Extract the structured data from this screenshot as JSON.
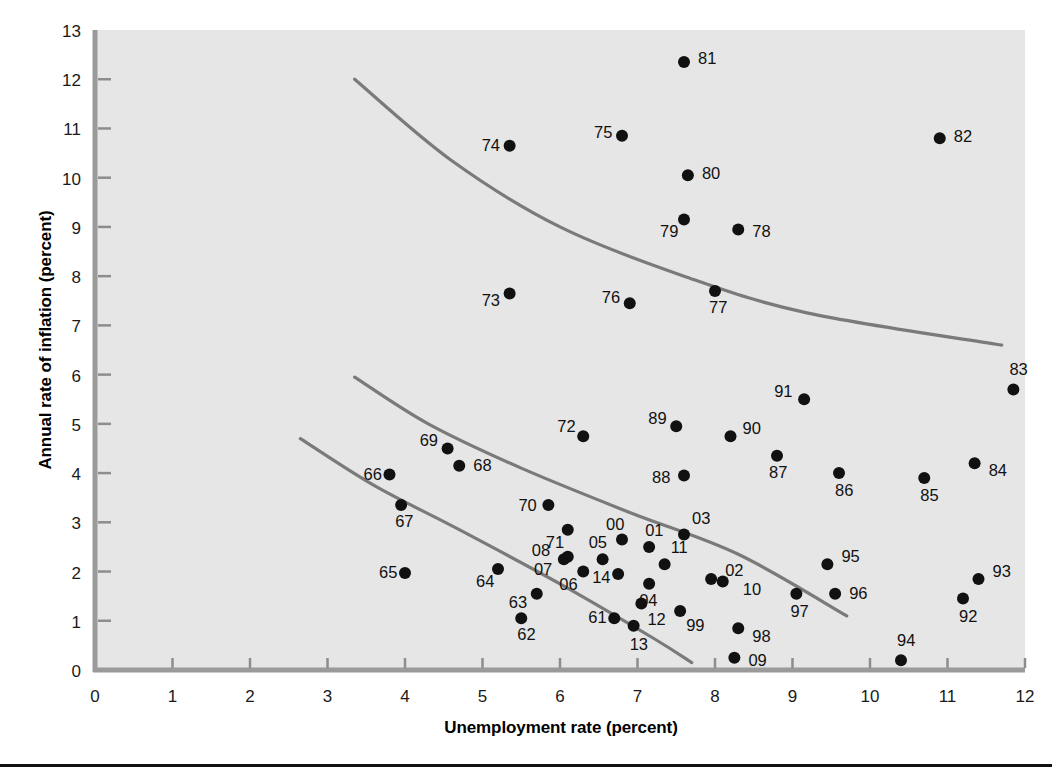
{
  "figure": {
    "background_color": "#ffffff",
    "plot_background_color": "#e6e6e6",
    "axis_color": "#9a9a9a",
    "curve_color": "#7a7a7a",
    "point_color": "#111111"
  },
  "axes": {
    "x_title": "Unemployment rate (percent)",
    "y_title": "Annual rate of inflation (percent)",
    "x_ticks": [
      "0",
      "1",
      "2",
      "3",
      "4",
      "5",
      "6",
      "7",
      "8",
      "9",
      "10",
      "11",
      "12"
    ],
    "y_ticks": [
      "0",
      "1",
      "2",
      "3",
      "4",
      "5",
      "6",
      "7",
      "8",
      "9",
      "10",
      "11",
      "12",
      "13"
    ]
  },
  "chart_data": {
    "type": "scatter",
    "title": "",
    "xlabel": "Unemployment rate (percent)",
    "ylabel": "Annual rate of inflation (percent)",
    "xlim": [
      0,
      12
    ],
    "ylim": [
      0,
      13
    ],
    "grid": false,
    "legend": "none",
    "point_label_position": "varies",
    "points": [
      {
        "label": "61",
        "x": 6.7,
        "y": 1.05,
        "lx": -26,
        "ly": 5
      },
      {
        "label": "62",
        "x": 5.5,
        "y": 1.05,
        "lx": -4,
        "ly": 22
      },
      {
        "label": "63",
        "x": 5.7,
        "y": 1.55,
        "lx": -28,
        "ly": 14
      },
      {
        "label": "64",
        "x": 5.2,
        "y": 2.05,
        "lx": -22,
        "ly": 18
      },
      {
        "label": "65",
        "x": 4.0,
        "y": 1.97,
        "lx": -26,
        "ly": 5
      },
      {
        "label": "66",
        "x": 3.8,
        "y": 3.97,
        "lx": -26,
        "ly": 5
      },
      {
        "label": "67",
        "x": 3.95,
        "y": 3.35,
        "lx": -6,
        "ly": 22
      },
      {
        "label": "68",
        "x": 4.7,
        "y": 4.15,
        "lx": 14,
        "ly": 5
      },
      {
        "label": "69",
        "x": 4.55,
        "y": 4.5,
        "lx": -28,
        "ly": -2
      },
      {
        "label": "70",
        "x": 5.85,
        "y": 3.35,
        "lx": -30,
        "ly": 6
      },
      {
        "label": "71",
        "x": 6.1,
        "y": 2.85,
        "lx": -22,
        "ly": 18
      },
      {
        "label": "72",
        "x": 6.3,
        "y": 4.75,
        "lx": -26,
        "ly": -4
      },
      {
        "label": "73",
        "x": 5.35,
        "y": 7.65,
        "lx": -28,
        "ly": 13
      },
      {
        "label": "74",
        "x": 5.35,
        "y": 10.65,
        "lx": -28,
        "ly": 5
      },
      {
        "label": "75",
        "x": 6.8,
        "y": 10.85,
        "lx": -28,
        "ly": 2
      },
      {
        "label": "76",
        "x": 6.9,
        "y": 7.45,
        "lx": -28,
        "ly": 0
      },
      {
        "label": "77",
        "x": 8.0,
        "y": 7.7,
        "lx": -6,
        "ly": 22
      },
      {
        "label": "78",
        "x": 8.3,
        "y": 8.95,
        "lx": 14,
        "ly": 8
      },
      {
        "label": "79",
        "x": 7.6,
        "y": 9.15,
        "lx": -24,
        "ly": 17
      },
      {
        "label": "80",
        "x": 7.65,
        "y": 10.05,
        "lx": 14,
        "ly": 4
      },
      {
        "label": "81",
        "x": 7.6,
        "y": 12.35,
        "lx": 14,
        "ly": 2
      },
      {
        "label": "82",
        "x": 10.9,
        "y": 10.8,
        "lx": 14,
        "ly": 4
      },
      {
        "label": "83",
        "x": 11.85,
        "y": 5.7,
        "lx": -4,
        "ly": -14
      },
      {
        "label": "84",
        "x": 11.35,
        "y": 4.2,
        "lx": 14,
        "ly": 13
      },
      {
        "label": "85",
        "x": 10.7,
        "y": 3.9,
        "lx": -4,
        "ly": 23
      },
      {
        "label": "86",
        "x": 9.6,
        "y": 4.0,
        "lx": -4,
        "ly": 23
      },
      {
        "label": "87",
        "x": 8.8,
        "y": 4.35,
        "lx": -8,
        "ly": 22
      },
      {
        "label": "88",
        "x": 7.6,
        "y": 3.95,
        "lx": -32,
        "ly": 7
      },
      {
        "label": "89",
        "x": 7.5,
        "y": 4.95,
        "lx": -28,
        "ly": -2
      },
      {
        "label": "90",
        "x": 8.2,
        "y": 4.75,
        "lx": 12,
        "ly": -2
      },
      {
        "label": "91",
        "x": 9.15,
        "y": 5.5,
        "lx": -30,
        "ly": -2
      },
      {
        "label": "92",
        "x": 11.2,
        "y": 1.45,
        "lx": -4,
        "ly": 23
      },
      {
        "label": "93",
        "x": 11.4,
        "y": 1.85,
        "lx": 14,
        "ly": -2
      },
      {
        "label": "94",
        "x": 10.4,
        "y": 0.2,
        "lx": -4,
        "ly": -14
      },
      {
        "label": "95",
        "x": 9.45,
        "y": 2.15,
        "lx": 14,
        "ly": -2
      },
      {
        "label": "96",
        "x": 9.55,
        "y": 1.55,
        "lx": 14,
        "ly": 5
      },
      {
        "label": "97",
        "x": 9.05,
        "y": 1.55,
        "lx": -6,
        "ly": 23
      },
      {
        "label": "98",
        "x": 8.3,
        "y": 0.85,
        "lx": 14,
        "ly": 14
      },
      {
        "label": "99",
        "x": 7.55,
        "y": 1.2,
        "lx": 6,
        "ly": 20
      },
      {
        "label": "00",
        "x": 6.8,
        "y": 2.65,
        "lx": -16,
        "ly": -10
      },
      {
        "label": "01",
        "x": 7.15,
        "y": 2.5,
        "lx": -4,
        "ly": -11
      },
      {
        "label": "02",
        "x": 7.95,
        "y": 1.85,
        "lx": 14,
        "ly": -3
      },
      {
        "label": "03",
        "x": 7.6,
        "y": 2.75,
        "lx": 8,
        "ly": -11
      },
      {
        "label": "04",
        "x": 7.15,
        "y": 1.75,
        "lx": -10,
        "ly": 22
      },
      {
        "label": "05",
        "x": 6.55,
        "y": 2.25,
        "lx": -14,
        "ly": -11
      },
      {
        "label": "06",
        "x": 6.3,
        "y": 2.0,
        "lx": -24,
        "ly": 18
      },
      {
        "label": "07",
        "x": 6.05,
        "y": 2.25,
        "lx": -30,
        "ly": 16
      },
      {
        "label": "08",
        "x": 6.1,
        "y": 2.3,
        "lx": -36,
        "ly": -1
      },
      {
        "label": "09",
        "x": 8.25,
        "y": 0.25,
        "lx": 14,
        "ly": 8
      },
      {
        "label": "10",
        "x": 8.1,
        "y": 1.8,
        "lx": 20,
        "ly": 14
      },
      {
        "label": "11",
        "x": 7.35,
        "y": 2.15,
        "lx": 6,
        "ly": -11
      },
      {
        "label": "12",
        "x": 7.05,
        "y": 1.35,
        "lx": 6,
        "ly": 21
      },
      {
        "label": "13",
        "x": 6.95,
        "y": 0.9,
        "lx": -4,
        "ly": 24
      },
      {
        "label": "14",
        "x": 6.75,
        "y": 1.95,
        "lx": -26,
        "ly": 9
      }
    ],
    "curves": [
      {
        "name": "upper-phillips-curve",
        "points": [
          [
            3.35,
            12.0
          ],
          [
            4.6,
            10.35
          ],
          [
            6.0,
            9.0
          ],
          [
            7.6,
            8.0
          ],
          [
            9.2,
            7.25
          ],
          [
            11.7,
            6.6
          ]
        ]
      },
      {
        "name": "middle-phillips-curve",
        "points": [
          [
            3.35,
            5.95
          ],
          [
            4.3,
            5.0
          ],
          [
            5.5,
            4.1
          ],
          [
            6.9,
            3.2
          ],
          [
            8.3,
            2.35
          ],
          [
            9.7,
            1.1
          ]
        ]
      },
      {
        "name": "lower-phillips-curve",
        "points": [
          [
            2.65,
            4.7
          ],
          [
            3.6,
            3.75
          ],
          [
            4.7,
            2.85
          ],
          [
            6.0,
            1.75
          ],
          [
            7.2,
            0.65
          ],
          [
            7.7,
            0.15
          ]
        ]
      }
    ]
  }
}
